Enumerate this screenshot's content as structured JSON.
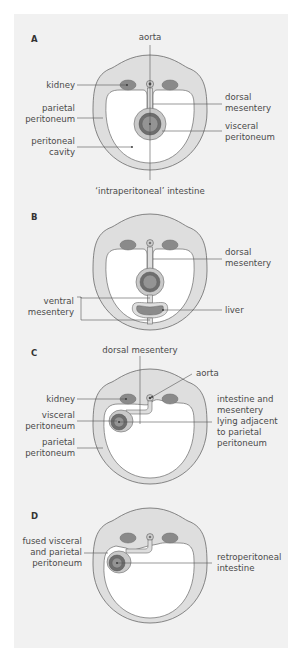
{
  "figure": {
    "panels": [
      {
        "id": "A",
        "letter": "A",
        "labels": {
          "aorta": "aorta",
          "kidney": "kidney",
          "parietal_1": "parietal",
          "parietal_2": "peritoneum",
          "cavity_1": "peritoneal",
          "cavity_2": "cavity",
          "dorsal_1": "dorsal",
          "dorsal_2": "mesentery",
          "visceral_1": "visceral",
          "visceral_2": "peritoneum",
          "intestine": "‘intraperitoneal’ intestine"
        }
      },
      {
        "id": "B",
        "letter": "B",
        "labels": {
          "dorsal_1": "dorsal",
          "dorsal_2": "mesentery",
          "ventral_1": "ventral",
          "ventral_2": "mesentery",
          "liver": "liver"
        }
      },
      {
        "id": "C",
        "letter": "C",
        "labels": {
          "dorsal": "dorsal mesentery",
          "aorta": "aorta",
          "kidney": "kidney",
          "visceral_1": "visceral",
          "visceral_2": "peritoneum",
          "parietal_1": "parietal",
          "parietal_2": "peritoneum",
          "adjacent_1": "intestine and",
          "adjacent_2": "mesentery",
          "adjacent_3": "lying adjacent",
          "adjacent_4": "to parietal",
          "adjacent_5": "peritoneum"
        }
      },
      {
        "id": "D",
        "letter": "D",
        "labels": {
          "fused_1": "fused visceral",
          "fused_2": "and parietal",
          "fused_3": "peritoneum",
          "retro_1": "retroperitoneal",
          "retro_2": "intestine"
        }
      }
    ],
    "colors": {
      "background": "#f1f1f1",
      "body_wall": "#dedede",
      "outline": "#6a6a6a",
      "cavity": "#ffffff",
      "organ": "#8a8a8a",
      "organ_dark": "#6e6e6e",
      "text": "#4a4a4a"
    }
  }
}
